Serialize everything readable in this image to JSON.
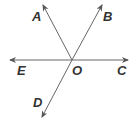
{
  "diagram": {
    "type": "geometry-rays",
    "line_color": "#666666",
    "label_color": "#333333",
    "center": {
      "label": "O",
      "x": 72,
      "y": 60
    },
    "rays": [
      {
        "label": "A",
        "tip": [
          43,
          5
        ],
        "label_pos": [
          33,
          20
        ]
      },
      {
        "label": "B",
        "tip": [
          102,
          5
        ],
        "label_pos": [
          103,
          20
        ]
      },
      {
        "label": "C",
        "tip": [
          128,
          60
        ],
        "label_pos": [
          118,
          76
        ]
      },
      {
        "label": "D",
        "tip": [
          42,
          117
        ],
        "label_pos": [
          34,
          107
        ]
      },
      {
        "label": "E",
        "tip": [
          10,
          60
        ],
        "label_pos": [
          18,
          76
        ]
      }
    ],
    "labels": {
      "A": "A",
      "B": "B",
      "C": "C",
      "D": "D",
      "E": "E",
      "O": "O"
    }
  }
}
